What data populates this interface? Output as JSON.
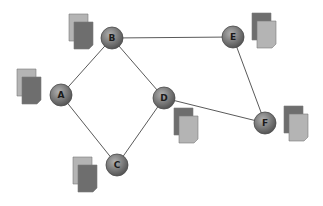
{
  "diagram": {
    "type": "network-graph",
    "colors": {
      "background": "#ffffff",
      "edge": "#5a5a5a",
      "node_fill_light": "#a8a8a8",
      "node_fill_dark": "#5e5e5e",
      "node_stroke": "#4a4a4a",
      "doc_light": "#b4b4b4",
      "doc_dark": "#6e6e6e",
      "doc_stroke": "#7a7a7a"
    },
    "nodes": [
      {
        "id": "A",
        "label": "A",
        "x": 61,
        "y": 95,
        "doc": {
          "x": 17,
          "y": 69,
          "front": "dark"
        }
      },
      {
        "id": "B",
        "label": "B",
        "x": 112,
        "y": 38,
        "doc": {
          "x": 69,
          "y": 14,
          "front": "dark"
        }
      },
      {
        "id": "C",
        "label": "C",
        "x": 117,
        "y": 165,
        "doc": {
          "x": 73,
          "y": 157,
          "front": "dark"
        }
      },
      {
        "id": "D",
        "label": "D",
        "x": 164,
        "y": 98,
        "doc": {
          "x": 174,
          "y": 108,
          "front": "light"
        }
      },
      {
        "id": "E",
        "label": "E",
        "x": 233,
        "y": 37,
        "doc": {
          "x": 252,
          "y": 13,
          "front": "light"
        }
      },
      {
        "id": "F",
        "label": "F",
        "x": 265,
        "y": 123,
        "doc": {
          "x": 284,
          "y": 106,
          "front": "light"
        }
      }
    ],
    "edges": [
      {
        "from": "A",
        "to": "B"
      },
      {
        "from": "A",
        "to": "C"
      },
      {
        "from": "B",
        "to": "D"
      },
      {
        "from": "B",
        "to": "E"
      },
      {
        "from": "C",
        "to": "D"
      },
      {
        "from": "D",
        "to": "F"
      },
      {
        "from": "E",
        "to": "F"
      }
    ]
  }
}
